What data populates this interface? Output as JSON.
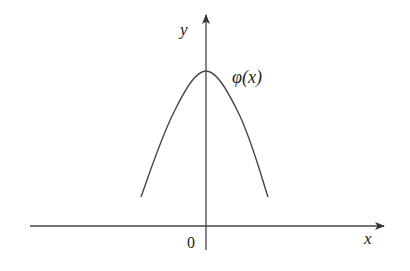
{
  "figure": {
    "colors": {
      "stroke": "#333333",
      "background": "#ffffff"
    },
    "axes": {
      "x_label": "x",
      "y_label": "y",
      "origin_label": "0"
    },
    "curve": {
      "label": "φ(x)",
      "shape": "bell-shaped, symmetric about the y-axis, maximum on the y-axis"
    }
  }
}
